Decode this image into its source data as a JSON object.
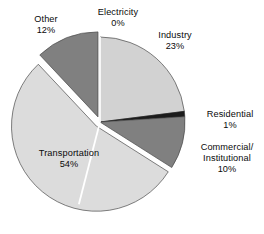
{
  "chart_data": {
    "type": "pie",
    "title": "",
    "subtitle": "",
    "xlabel": "",
    "ylabel": "",
    "legend_position": "none",
    "grid": false,
    "units": "percent",
    "start_angle_deg": 0,
    "direction": "clockwise",
    "categories": [
      "Electricity",
      "Industry",
      "Residential",
      "Commercial/Institutional",
      "Transportation",
      "Other"
    ],
    "values": [
      0,
      23,
      1,
      10,
      54,
      12
    ],
    "slices": [
      {
        "name": "Electricity",
        "label_line1": "Electricity",
        "label_line2": "",
        "value_label": "0%",
        "value": 0,
        "color": "#ffffff",
        "exploded": false
      },
      {
        "name": "Industry",
        "label_line1": "Industry",
        "label_line2": "",
        "value_label": "23%",
        "value": 23,
        "color": "#d2d2d2",
        "exploded": false
      },
      {
        "name": "Residential",
        "label_line1": "Residential",
        "label_line2": "",
        "value_label": "1%",
        "value": 1,
        "color": "#1c1c1c",
        "exploded": false
      },
      {
        "name": "Commercial/Institutional",
        "label_line1": "Commercial/",
        "label_line2": "Institutional",
        "value_label": "10%",
        "value": 10,
        "color": "#808080",
        "exploded": false
      },
      {
        "name": "Transportation",
        "label_line1": "Transportation",
        "label_line2": "",
        "value_label": "54%",
        "value": 54,
        "color": "#dcdcdc",
        "exploded": true
      },
      {
        "name": "Other",
        "label_line1": "Other",
        "label_line2": "",
        "value_label": "12%",
        "value": 12,
        "color": "#808080",
        "exploded": true
      }
    ],
    "colors": {
      "background": "#ffffff",
      "text": "#0a0a0a",
      "outline": "#4a4a4a",
      "separator": "#ffffff"
    }
  }
}
